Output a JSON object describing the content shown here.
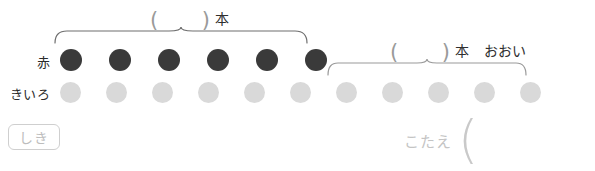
{
  "worksheet": {
    "rows": [
      {
        "key": "red",
        "label": "赤",
        "color": "#3a3a3a",
        "count": 6,
        "start_x": 60,
        "step": 49
      },
      {
        "key": "yellow",
        "label": "きいろ",
        "color": "#d9d9d9",
        "count": 11,
        "start_x": 60,
        "step": 46
      }
    ],
    "top_label": {
      "open_paren": "(",
      "close_paren": ")",
      "unit": "本"
    },
    "bottom_label": {
      "open_paren": "(",
      "close_paren": ")",
      "unit": "本",
      "comparison": "おおい"
    },
    "shiki": {
      "label": "しき"
    },
    "kotae": {
      "label": "こたえ",
      "open_paren": "("
    },
    "colors": {
      "red_counter": "#3a3a3a",
      "yellow_counter": "#d9d9d9",
      "text": "#2b2b2b",
      "muted": "#c4c4c4",
      "brace": "#6f6f6f",
      "brace_light": "#bdbdbd"
    }
  }
}
